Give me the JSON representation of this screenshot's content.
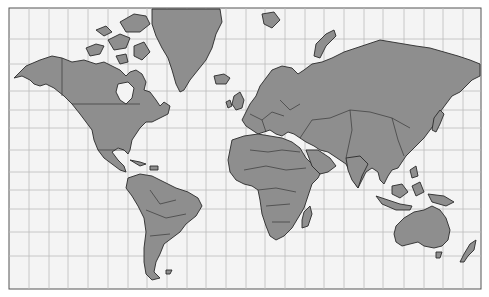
{
  "map": {
    "title": "",
    "projection": "Mercator",
    "frame": {
      "x": 9,
      "y": 8,
      "width": 472,
      "height": 281
    },
    "colors": {
      "background": "#f4f4f4",
      "land": "#8e8e8e",
      "outline": "#2a2a2a",
      "grid": "#bdbdbd",
      "frame": "#555555"
    },
    "grid": {
      "meridian_spacing_deg": 15,
      "meridians_x": [
        29,
        49,
        68,
        88,
        108,
        128,
        147,
        167,
        187,
        206,
        226,
        246,
        265,
        285,
        305,
        324,
        344,
        364,
        383,
        404,
        424,
        443,
        463
      ],
      "parallels_y": [
        39,
        64,
        91,
        110,
        128,
        150,
        172,
        190,
        209,
        232,
        256
      ]
    },
    "regions": [
      {
        "name": "North America"
      },
      {
        "name": "Greenland"
      },
      {
        "name": "South America"
      },
      {
        "name": "Europe"
      },
      {
        "name": "Africa"
      },
      {
        "name": "Asia"
      },
      {
        "name": "Australia"
      },
      {
        "name": "New Zealand"
      },
      {
        "name": "Madagascar"
      },
      {
        "name": "Japan"
      },
      {
        "name": "Indonesia"
      },
      {
        "name": "Canadian Arctic Archipelago"
      },
      {
        "name": "Svalbard"
      },
      {
        "name": "Iceland"
      },
      {
        "name": "British Isles"
      },
      {
        "name": "Novaya Zemlya"
      }
    ]
  }
}
